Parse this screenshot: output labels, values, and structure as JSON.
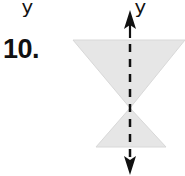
{
  "page": {
    "top_clipped_glyphs": [
      {
        "text": "y",
        "x": 22
      },
      {
        "text": "y",
        "x": 135
      }
    ]
  },
  "problem": {
    "number": "10."
  },
  "figure": {
    "fill_color": "#e6e6e6",
    "stroke_color": "#111111",
    "top_triangle": {
      "points": [
        [
          73,
          40
        ],
        [
          185,
          40
        ],
        [
          130,
          108
        ]
      ]
    },
    "bottom_triangle": {
      "points": [
        [
          130,
          108
        ],
        [
          96,
          147
        ],
        [
          166,
          147
        ]
      ]
    },
    "symmetry_line": {
      "x": 130,
      "y_start": 10,
      "y_end": 175,
      "style": "dashed",
      "arrows": "both"
    }
  }
}
